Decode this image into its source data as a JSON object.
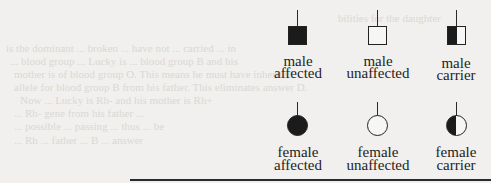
{
  "legend": {
    "items": [
      {
        "id": "male-affected",
        "shape": "square",
        "fill": "filled",
        "line1": "male",
        "line2": "affected"
      },
      {
        "id": "male-unaffected",
        "shape": "square",
        "fill": "empty",
        "line1": "male",
        "line2": "unaffected"
      },
      {
        "id": "male-carrier",
        "shape": "square",
        "fill": "half",
        "line1": "male",
        "line2": "carrier"
      },
      {
        "id": "female-affected",
        "shape": "circle",
        "fill": "filled",
        "line1": "female",
        "line2": "affected"
      },
      {
        "id": "female-unaffected",
        "shape": "circle",
        "fill": "empty",
        "line1": "female",
        "line2": "unaffected"
      },
      {
        "id": "female-carrier",
        "shape": "circle",
        "fill": "half",
        "line1": "female",
        "line2": "carrier"
      }
    ]
  },
  "colors": {
    "paper": "#f1f0ee",
    "ink": "#1b1b1b",
    "bleed_through": "#d9d8d5"
  },
  "bleed_through_text": [
    "bilities for the daughter",
    "is the dominant ... broken ... have not ... carried ... in",
    "... blood group ... Lucky is ... blood group B and his",
    "mother is of blood group O. This means he must have inherited",
    "allele for blood group B from his father. This eliminates answer D.",
    "Now ... Lucky is Rh- and his mother is Rh+",
    "... Rh- gene from his father ...",
    "... possible ... passing ... thus ... be",
    "... Rh ... father ... B ... answer"
  ]
}
